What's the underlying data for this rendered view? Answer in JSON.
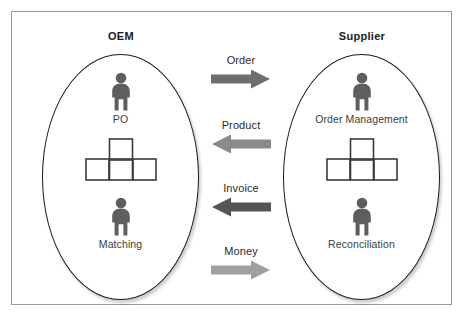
{
  "diagram": {
    "title_oem": "OEM",
    "title_supplier": "Supplier",
    "frame_color": "#9a9a9a",
    "ellipse_stroke": "#1b1b1b",
    "person_color": "#5e5e5e",
    "box_stroke": "#3a3a3a"
  },
  "oem": {
    "label": "OEM",
    "nodes": [
      {
        "icon": "person-icon",
        "label": "PO"
      },
      {
        "icon": "blocks-icon",
        "label": ""
      },
      {
        "icon": "person-icon",
        "label": "Matching"
      }
    ]
  },
  "supplier": {
    "label": "Supplier",
    "nodes": [
      {
        "icon": "person-icon",
        "label": "Order Management"
      },
      {
        "icon": "blocks-icon",
        "label": ""
      },
      {
        "icon": "person-icon",
        "label": "Reconciliation"
      }
    ]
  },
  "flows": [
    {
      "label": "Order",
      "direction": "right",
      "color": "#6e6e6e"
    },
    {
      "label": "Product",
      "direction": "left",
      "color": "#8a8a8a"
    },
    {
      "label": "Invoice",
      "direction": "left",
      "color": "#555555"
    },
    {
      "label": "Money",
      "direction": "right",
      "color": "#a0a0a0"
    }
  ]
}
